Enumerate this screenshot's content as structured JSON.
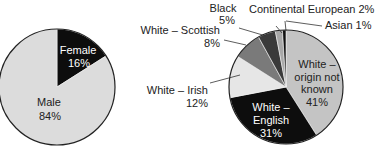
{
  "chart_data": [
    {
      "type": "pie",
      "title": "",
      "categories": [
        "Female",
        "Male"
      ],
      "values": [
        16,
        84
      ],
      "labels": [
        "Female 16%",
        "Male 84%"
      ],
      "colors": [
        "#0d0d0d",
        "#dcdcdc"
      ]
    },
    {
      "type": "pie",
      "title": "",
      "categories": [
        "White – origin not known",
        "White – English",
        "White – Irish",
        "White – Scottish",
        "Black",
        "Continental European",
        "Asian"
      ],
      "values": [
        41,
        31,
        12,
        8,
        5,
        2,
        1
      ],
      "labels": [
        "White – origin not known 41%",
        "White – English 31%",
        "White – Irish 12%",
        "White – Scottish 8%",
        "Black 5%",
        "Continental European 2%",
        "Asian 1%"
      ],
      "colors": [
        "#c4c4c4",
        "#0d0d0d",
        "#e6e6e6",
        "#7a7a7a",
        "#3a3a3a",
        "#a8a8a8",
        "#111111"
      ]
    }
  ],
  "left": {
    "female_name": "Female",
    "female_pct": "16%",
    "male_name": "Male",
    "male_pct": "84%"
  },
  "right": {
    "black_name": "Black",
    "black_pct": "5%",
    "continental": "Continental European 2%",
    "asian": "Asian 1%",
    "scottish_name": "White – Scottish",
    "scottish_pct": "8%",
    "irish_name": "White – Irish",
    "irish_pct": "12%",
    "unknown_l1": "White –",
    "unknown_l2": "origin not",
    "unknown_l3": "known",
    "unknown_pct": "41%",
    "english_l1": "White –",
    "english_l2": "English",
    "english_pct": "31%"
  }
}
